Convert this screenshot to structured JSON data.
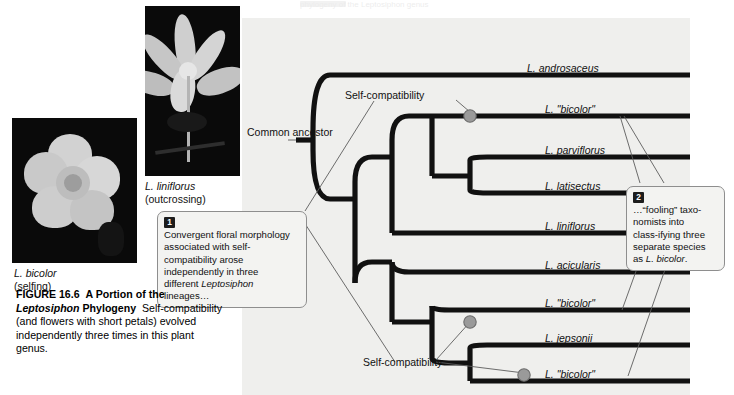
{
  "header_strip": {
    "visible_fragment": "phylogeny of the Leptosiphon genus"
  },
  "figure": {
    "number": "FIGURE 16.6",
    "title_plain_1": "A Portion of the",
    "title_italic": "Leptosiphon",
    "title_plain_2": "Phylogeny",
    "body": "Self-compatibility (and flowers with short petals) evolved independently three times in this plant genus."
  },
  "photos": [
    {
      "name": "liniflorus-photo",
      "species": "L. liniflorus",
      "mating_system": "(outcrossing)",
      "description": "grayscale photograph of a star-shaped flower with long narrow pale petals on a black background"
    },
    {
      "name": "bicolor-photo",
      "species": "L. bicolor",
      "mating_system": "(selfing)",
      "description": "grayscale photograph of a small flower with short rounded pale petals on a dark background"
    }
  ],
  "tree": {
    "root_label": "Common ancestor",
    "taxa": [
      {
        "label": "L. androsaceus",
        "y": 75
      },
      {
        "label": "L. \"bicolor\"",
        "y": 116
      },
      {
        "label": "L. parviflorus",
        "y": 157
      },
      {
        "label": "L. latisectus",
        "y": 193
      },
      {
        "label": "L. liniflorus",
        "y": 233
      },
      {
        "label": "L. acicularis",
        "y": 272
      },
      {
        "label": "L. \"bicolor\"",
        "y": 310
      },
      {
        "label": "L. jepsonii",
        "y": 345
      },
      {
        "label": "L. \"bicolor\"",
        "y": 381
      }
    ],
    "event_labels": [
      {
        "name": "self-compatibility-upper",
        "text": "Self-compatibility"
      },
      {
        "name": "self-compatibility-lower",
        "text": "Self-compatibility"
      }
    ],
    "node_marker_count": 3,
    "colors": {
      "panel_background": "#efefed",
      "branch": "#111111",
      "event_node_fill": "#9a9a9a",
      "event_node_stroke": "#6d6d6d",
      "leader_line": "#5c5c5c",
      "callout_border": "#8e8e8e",
      "callout_background": "#f3f3f1",
      "badge_background": "#1d1d1d"
    }
  },
  "callouts": [
    {
      "number": "1",
      "text_before_italic": "Convergent floral morphology associated with self-compatibility arose independently in three different ",
      "italic": "Leptosiphon",
      "text_after_italic": " lineages…"
    },
    {
      "number": "2",
      "text_before_italic": "…“fooling” taxo-nomists into class-ifying three separate species as ",
      "italic": "L. bicolor",
      "text_after_italic": "."
    }
  ]
}
